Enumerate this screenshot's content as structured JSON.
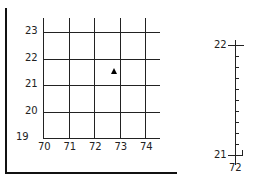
{
  "grid": {
    "x_labels": [
      "70",
      "71",
      "72",
      "73",
      "74"
    ],
    "y_labels": [
      "19",
      "20",
      "21",
      "22",
      "23"
    ],
    "x_values": [
      70,
      71,
      72,
      73,
      74
    ],
    "y_values": [
      19,
      20,
      21,
      22,
      23
    ]
  },
  "point": {
    "x": 72.8,
    "y": 21.5,
    "shape": "triangle"
  },
  "scale": {
    "top_label": "22",
    "bottom_label": "21",
    "under_label": "72",
    "minor_ticks": 9
  }
}
